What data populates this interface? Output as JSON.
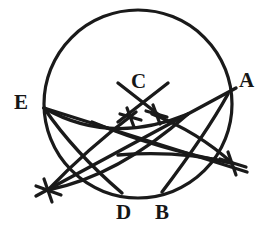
{
  "figure": {
    "style": {
      "ink_color": "#1a1a1a",
      "background_color": "#ffffff",
      "label_color": "#161616"
    },
    "canvas": {
      "width": 280,
      "height": 233
    }
  },
  "labels": [
    {
      "id": "label-E",
      "text": "E",
      "x": 14,
      "y": 92,
      "point": {
        "x": 44,
        "y": 108
      }
    },
    {
      "id": "label-C",
      "text": "C",
      "x": 131,
      "y": 71,
      "point": {
        "x": 143,
        "y": 103
      }
    },
    {
      "id": "label-A",
      "text": "A",
      "x": 239,
      "y": 70,
      "point": {
        "x": 228,
        "y": 94
      }
    },
    {
      "id": "label-D",
      "text": "D",
      "x": 116,
      "y": 202,
      "point": {
        "x": 122,
        "y": 193
      }
    },
    {
      "id": "label-B",
      "text": "B",
      "x": 155,
      "y": 202,
      "point": {
        "x": 162,
        "y": 192
      }
    }
  ],
  "main_circle": {
    "name": "main-circle",
    "center_x": 138,
    "center_y": 104,
    "radius": 94
  },
  "arcs": [
    {
      "id": "arc-left-upper",
      "d": "M 44 108 Q 110 146 188 114"
    },
    {
      "id": "arc-left-lower",
      "d": "M 48 190 Q 118 176 188 114"
    },
    {
      "id": "arc-left-bow-a",
      "d": "M 48 190 Q 86 150 136 112"
    },
    {
      "id": "arc-left-bow-b",
      "d": "M 44 108 Q 74 152 122 193"
    },
    {
      "id": "arc-right-upper",
      "d": "M 92 122 Q 160 150 232 163"
    },
    {
      "id": "arc-right-lower",
      "d": "M 118 155 Q 178 150 232 163"
    },
    {
      "id": "arc-right-bow-a",
      "d": "M 152 114 Q 198 132 232 163"
    },
    {
      "id": "arc-right-bow-b",
      "d": "M 228 94 Q 206 134 162 192"
    }
  ],
  "straight_lines": [
    {
      "id": "line-E-to-right-cross",
      "x1": 44,
      "y1": 108,
      "x2": 247,
      "y2": 172
    },
    {
      "id": "line-A-to-left-cross",
      "x1": 236,
      "y1": 88,
      "x2": 36,
      "y2": 196
    },
    {
      "id": "line-C-chord-left",
      "x1": 118,
      "y1": 83,
      "x2": 168,
      "y2": 122
    },
    {
      "id": "line-C-chord-right",
      "x1": 168,
      "y1": 83,
      "x2": 118,
      "y2": 122
    }
  ],
  "tick_marks": [
    {
      "id": "tick-cross-left",
      "cx": 48,
      "cy": 190,
      "size": 13,
      "angle": 20
    },
    {
      "id": "tick-cross-right",
      "cx": 232,
      "cy": 163,
      "size": 13,
      "angle": 20
    },
    {
      "id": "tick-cross-c-left",
      "cx": 130,
      "cy": 117,
      "size": 10,
      "angle": 25
    },
    {
      "id": "tick-cross-c-right",
      "cx": 156,
      "cy": 114,
      "size": 10,
      "angle": 25
    }
  ]
}
